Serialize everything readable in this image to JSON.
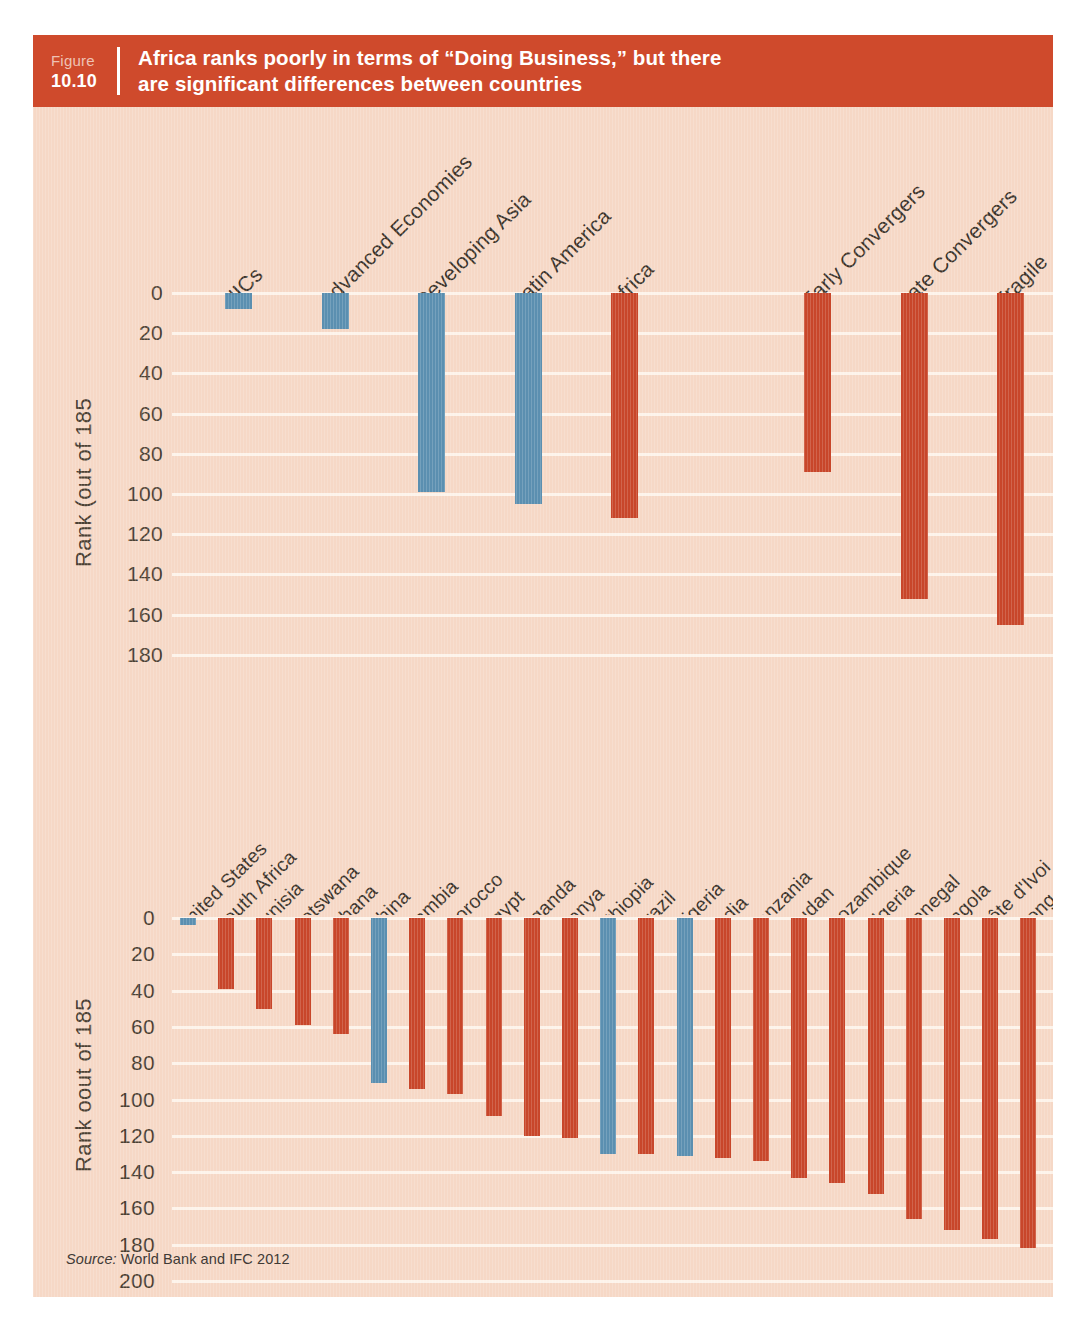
{
  "figure": {
    "label_word": "Figure",
    "number": "10.10",
    "title_line1": "Africa ranks poorly in terms of “Doing Business,” but there",
    "title_line2": "are significant differences between countries",
    "header_color": "#cf4a2c",
    "panel_color": "#f6d8c6"
  },
  "source": {
    "prefix": "Source:",
    "text": " World Bank and IFC 2012"
  },
  "colors": {
    "red": "#c8462a",
    "blue": "#5b8fb0",
    "gridline": "#fdf3ea",
    "text": "#4b4033"
  },
  "chart_data": [
    {
      "type": "bar",
      "id": "top",
      "title": "",
      "xlabel": "",
      "ylabel": "Rank (out of 185",
      "ylim": [
        0,
        185
      ],
      "y_inverted": true,
      "grid": true,
      "yticks": [
        0,
        20,
        40,
        60,
        80,
        100,
        120,
        140,
        160,
        180
      ],
      "ytick_labels": [
        "0",
        "20",
        "40",
        "60",
        "80",
        "100",
        "120",
        "140",
        "160",
        "180"
      ],
      "categories": [
        "NICs",
        "Advanced Economies",
        "Developing Asia",
        "Latin America",
        "Africa",
        "",
        "Early Convergers",
        "Late Convergers",
        "Fragile"
      ],
      "values": [
        8,
        18,
        99,
        105,
        112,
        null,
        89,
        152,
        165
      ],
      "colors": [
        "blue",
        "blue",
        "blue",
        "blue",
        "red",
        null,
        "red",
        "red",
        "red"
      ],
      "legend": []
    },
    {
      "type": "bar",
      "id": "bottom",
      "title": "",
      "xlabel": "",
      "ylabel": "Rank oout of 185",
      "ylim": [
        0,
        200
      ],
      "y_inverted": true,
      "grid": true,
      "yticks": [
        0,
        20,
        40,
        60,
        80,
        100,
        120,
        140,
        160,
        180,
        200
      ],
      "ytick_labels": [
        "0",
        "20",
        "40",
        "60",
        "80",
        "100",
        "120",
        "140",
        "160",
        "180",
        "200"
      ],
      "categories": [
        "United States",
        "South Africa",
        "Tunisia",
        "Botswana",
        "Ghana",
        "China",
        "Zambia",
        "Morocco",
        "Egypt",
        "Uganda",
        "Kenya",
        "Ethiopia",
        "Brazil",
        "Nigeria",
        "India",
        "Tanzania",
        "Sudan",
        "Mozambique",
        "Algeria",
        "Senegal",
        "Angola",
        "Côte d'Ivoi",
        "Cong"
      ],
      "values": [
        4,
        39,
        50,
        59,
        64,
        91,
        94,
        97,
        109,
        120,
        121,
        130,
        130,
        131,
        132,
        134,
        143,
        146,
        152,
        166,
        172,
        177,
        182
      ],
      "colors": [
        "blue",
        "red",
        "red",
        "red",
        "red",
        "blue",
        "red",
        "red",
        "red",
        "red",
        "red",
        "blue",
        "red",
        "blue",
        "red",
        "red",
        "red",
        "red",
        "red",
        "red",
        "red",
        "red",
        "red"
      ],
      "legend": []
    }
  ]
}
